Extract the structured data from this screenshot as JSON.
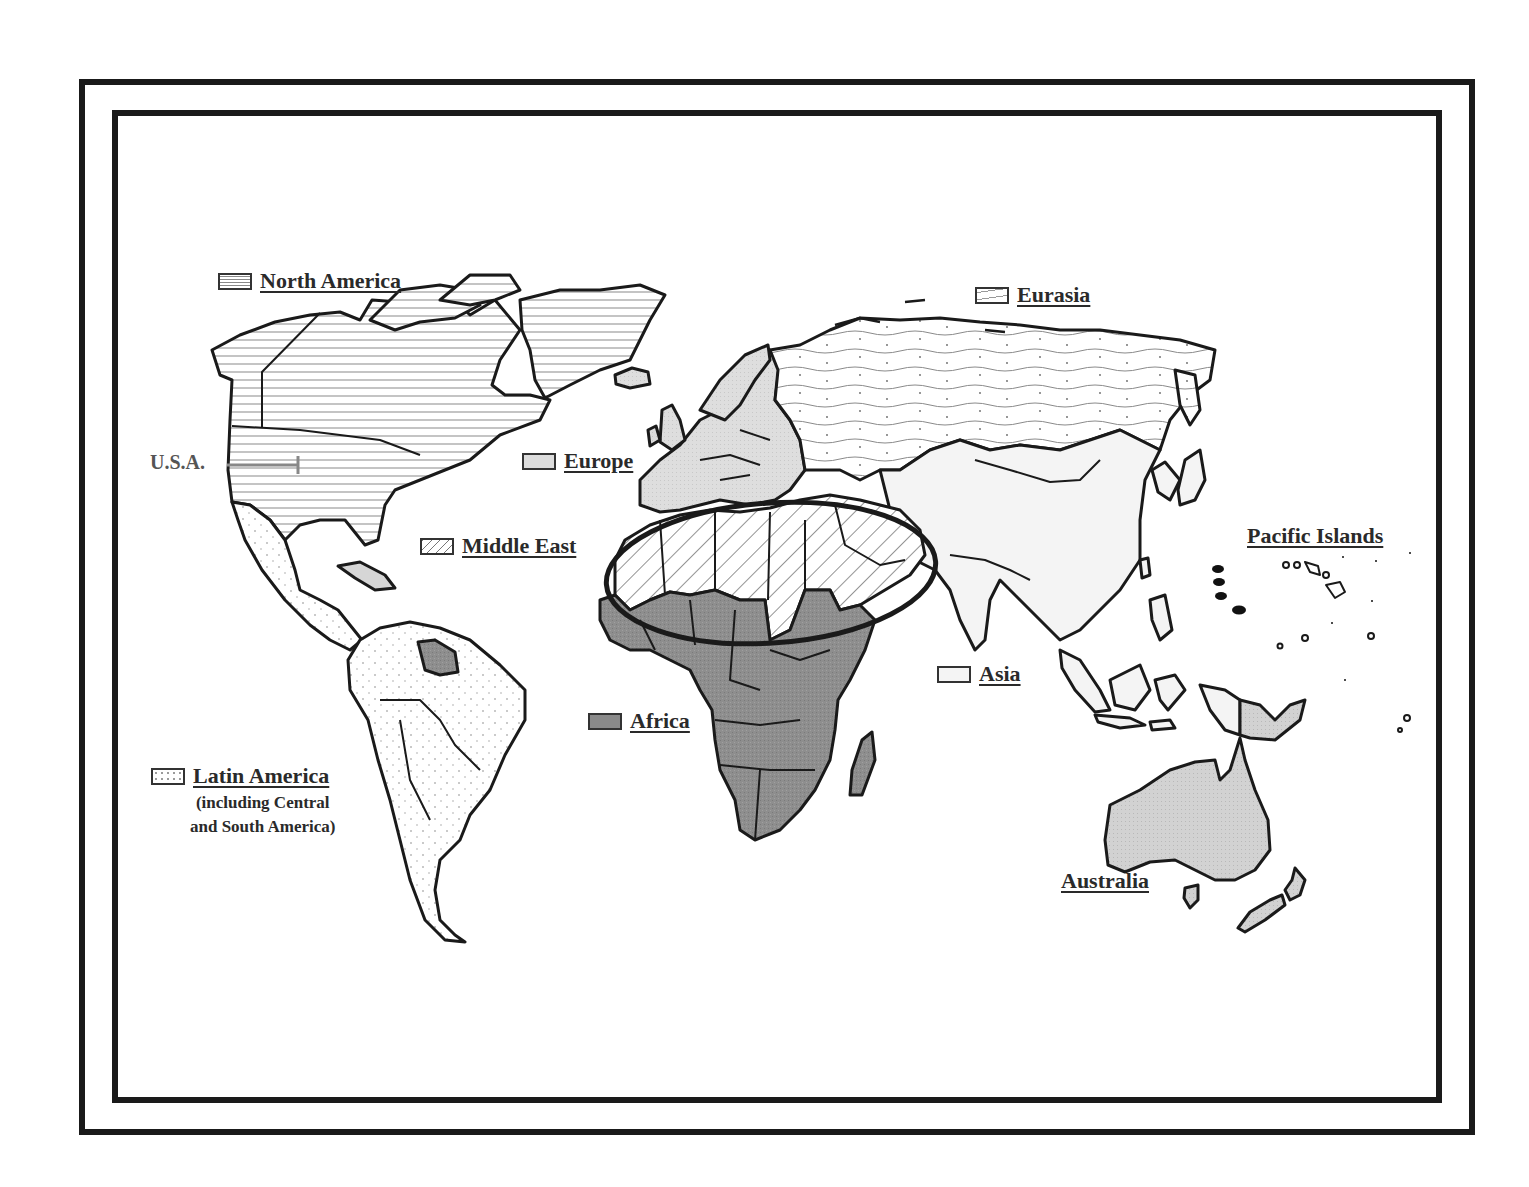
{
  "map": {
    "type": "world-regions-map",
    "colors": {
      "frame": "#1a1a1a",
      "outline": "#1a1a1a",
      "africa_fill": "#8a8a8a",
      "europe_fill": "#dcdcdc",
      "australia_fill": "#d4d4d4",
      "asia_fill": "#f4f4f4",
      "hatch_line": "#777777",
      "pacific_islands_dot": "#111111"
    },
    "highlight": {
      "shape": "ellipse",
      "region": "Middle East",
      "description": "thick black ellipse encircling North Africa and the Middle East"
    }
  },
  "legend": {
    "north_america": {
      "label": "North America",
      "pattern": "horizontal-lines"
    },
    "usa": {
      "label": "U.S.A."
    },
    "eurasia": {
      "label": "Eurasia",
      "pattern": "wavy-lines-with-dots"
    },
    "europe": {
      "label": "Europe",
      "pattern": "light-gray-fill"
    },
    "middle_east": {
      "label": "Middle East",
      "pattern": "diagonal-hatch"
    },
    "africa": {
      "label": "Africa",
      "pattern": "dark-gray-fill"
    },
    "asia": {
      "label": "Asia",
      "pattern": "very-light-fill"
    },
    "latin_america": {
      "label": "Latin America",
      "sublabel_line1": "(including Central",
      "sublabel_line2": "and South America)",
      "pattern": "dotted"
    },
    "pacific_islands": {
      "label": "Pacific Islands"
    },
    "australia": {
      "label": "Australia"
    }
  }
}
